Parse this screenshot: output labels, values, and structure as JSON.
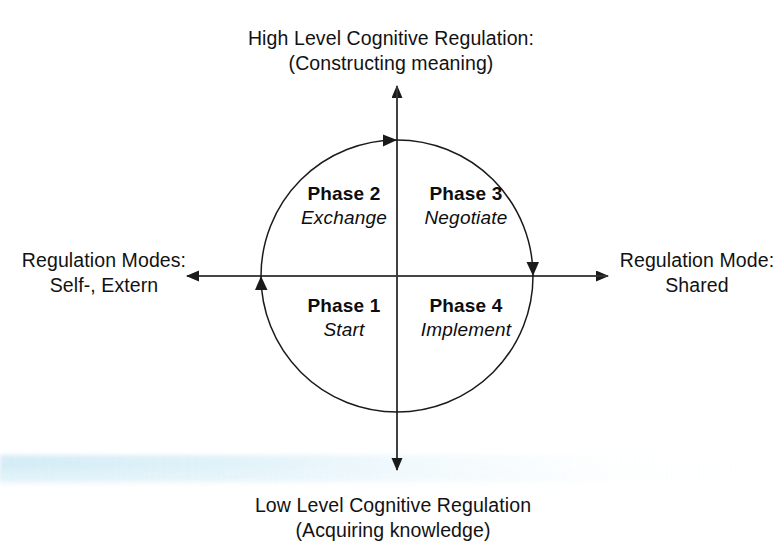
{
  "diagram": {
    "type": "quadrant-cycle",
    "axes": {
      "vertical": {
        "top_label_line1": "High Level Cognitive Regulation:",
        "top_label_line2": "(Constructing meaning)",
        "bottom_label_line1": "Low Level Cognitive Regulation",
        "bottom_label_line2": "(Acquiring knowledge)"
      },
      "horizontal": {
        "left_label_line1": "Regulation Modes:",
        "left_label_line2": "Self-, Extern",
        "right_label_line1": "Regulation Mode:",
        "right_label_line2": "Shared"
      }
    },
    "quadrants": [
      {
        "id": "phase2",
        "position": "top-left",
        "title": "Phase 2",
        "subtitle": "Exchange"
      },
      {
        "id": "phase3",
        "position": "top-right",
        "title": "Phase 3",
        "subtitle": "Negotiate"
      },
      {
        "id": "phase1",
        "position": "bottom-left",
        "title": "Phase 1",
        "subtitle": "Start"
      },
      {
        "id": "phase4",
        "position": "bottom-right",
        "title": "Phase 4",
        "subtitle": "Implement"
      }
    ],
    "cycle": {
      "direction": "clockwise",
      "arrow_positions": [
        "top",
        "right",
        "left"
      ]
    },
    "colors": {
      "stroke": "#1a1a1a",
      "text": "#121212",
      "background": "#ffffff",
      "scan_artifact": "#cde9f4"
    }
  }
}
